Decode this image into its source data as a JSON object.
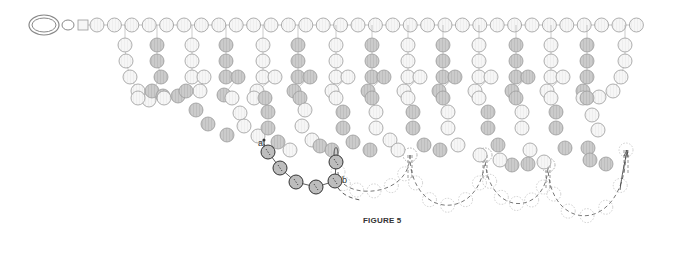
{
  "figure": {
    "caption": "FIGURE 5",
    "labels": {
      "a": "a",
      "b": "b"
    }
  },
  "colors": {
    "bead_white_fill": "#f5f5f5",
    "bead_gray_fill": "#c8c8c8",
    "bead_stroke": "#9a9a9a",
    "active_bead_fill": "#bdbdbd",
    "active_bead_stroke": "#333333",
    "ghost_stroke": "#b0b0b0",
    "thread": "#333333"
  },
  "clasp": {
    "ring_outer": {
      "cx": 44,
      "cy": 25,
      "rx": 15,
      "ry": 10
    },
    "ring_small": {
      "cx": 68,
      "cy": 25,
      "rx": 6,
      "ry": 5
    },
    "square": {
      "x": 78,
      "y": 20,
      "w": 10,
      "h": 10
    }
  },
  "top_row": {
    "start_x": 97,
    "y": 25,
    "count": 32,
    "spacing": 17.4,
    "r": 7
  },
  "fringes": [
    {
      "x": 125,
      "color": "white",
      "rows": [
        {
          "dx": 0,
          "dy": 20
        },
        {
          "dx": 1,
          "dy": 36
        },
        {
          "dx": 5,
          "dy": 52
        },
        {
          "dx": 13,
          "dy": 66
        },
        {
          "dx": 24,
          "dy": 75
        }
      ]
    },
    {
      "x": 157,
      "color": "gray",
      "rows": [
        {
          "dx": 0,
          "dy": 20
        },
        {
          "dx": 0,
          "dy": 36
        },
        {
          "dx": 4,
          "dy": 52
        },
        {
          "dx": -5,
          "dy": 66
        },
        {
          "dx": 6,
          "dy": 71
        }
      ]
    },
    {
      "x": 192,
      "color": "white",
      "rows": [
        {
          "dx": 0,
          "dy": 20
        },
        {
          "dx": 0,
          "dy": 36
        },
        {
          "dx": 0,
          "dy": 52
        },
        {
          "dx": 12,
          "dy": 52
        },
        {
          "dx": 8,
          "dy": 66
        }
      ]
    },
    {
      "x": 226,
      "color": "gray",
      "rows": [
        {
          "dx": 0,
          "dy": 20
        },
        {
          "dx": 0,
          "dy": 36
        },
        {
          "dx": 0,
          "dy": 52
        },
        {
          "dx": 12,
          "dy": 52
        },
        {
          "dx": -2,
          "dy": 70
        }
      ]
    },
    {
      "x": 263,
      "color": "white",
      "rows": [
        {
          "dx": 0,
          "dy": 20
        },
        {
          "dx": 0,
          "dy": 36
        },
        {
          "dx": 0,
          "dy": 52
        },
        {
          "dx": 12,
          "dy": 52
        },
        {
          "dx": -6,
          "dy": 66
        }
      ]
    },
    {
      "x": 298,
      "color": "gray",
      "rows": [
        {
          "dx": 0,
          "dy": 20
        },
        {
          "dx": 0,
          "dy": 36
        },
        {
          "dx": 0,
          "dy": 52
        },
        {
          "dx": 12,
          "dy": 52
        },
        {
          "dx": -4,
          "dy": 66
        }
      ]
    },
    {
      "x": 336,
      "color": "white",
      "rows": [
        {
          "dx": 0,
          "dy": 20
        },
        {
          "dx": 0,
          "dy": 36
        },
        {
          "dx": 0,
          "dy": 52
        },
        {
          "dx": 12,
          "dy": 52
        },
        {
          "dx": -4,
          "dy": 66
        }
      ]
    },
    {
      "x": 372,
      "color": "gray",
      "rows": [
        {
          "dx": 0,
          "dy": 20
        },
        {
          "dx": 0,
          "dy": 36
        },
        {
          "dx": 0,
          "dy": 52
        },
        {
          "dx": 12,
          "dy": 52
        },
        {
          "dx": -4,
          "dy": 66
        }
      ]
    },
    {
      "x": 408,
      "color": "white",
      "rows": [
        {
          "dx": 0,
          "dy": 20
        },
        {
          "dx": 0,
          "dy": 36
        },
        {
          "dx": 0,
          "dy": 52
        },
        {
          "dx": 12,
          "dy": 52
        },
        {
          "dx": -4,
          "dy": 66
        }
      ]
    },
    {
      "x": 443,
      "color": "gray",
      "rows": [
        {
          "dx": 0,
          "dy": 20
        },
        {
          "dx": 0,
          "dy": 36
        },
        {
          "dx": 0,
          "dy": 52
        },
        {
          "dx": 12,
          "dy": 52
        },
        {
          "dx": -4,
          "dy": 66
        }
      ]
    },
    {
      "x": 479,
      "color": "white",
      "rows": [
        {
          "dx": 0,
          "dy": 20
        },
        {
          "dx": 0,
          "dy": 36
        },
        {
          "dx": 0,
          "dy": 52
        },
        {
          "dx": 12,
          "dy": 52
        },
        {
          "dx": -4,
          "dy": 66
        }
      ]
    },
    {
      "x": 516,
      "color": "gray",
      "rows": [
        {
          "dx": 0,
          "dy": 20
        },
        {
          "dx": 0,
          "dy": 36
        },
        {
          "dx": 0,
          "dy": 52
        },
        {
          "dx": 12,
          "dy": 52
        },
        {
          "dx": -4,
          "dy": 66
        }
      ]
    },
    {
      "x": 551,
      "color": "white",
      "rows": [
        {
          "dx": 0,
          "dy": 20
        },
        {
          "dx": 0,
          "dy": 36
        },
        {
          "dx": 0,
          "dy": 52
        },
        {
          "dx": 12,
          "dy": 52
        },
        {
          "dx": -4,
          "dy": 66
        }
      ]
    },
    {
      "x": 587,
      "color": "gray",
      "rows": [
        {
          "dx": 0,
          "dy": 20
        },
        {
          "dx": 0,
          "dy": 36
        },
        {
          "dx": 0,
          "dy": 52
        },
        {
          "dx": -4,
          "dy": 66
        }
      ]
    },
    {
      "x": 625,
      "color": "white",
      "rows": [
        {
          "dx": 0,
          "dy": 20
        },
        {
          "dx": 0,
          "dy": 36
        },
        {
          "dx": -4,
          "dy": 52
        },
        {
          "dx": -12,
          "dy": 66
        },
        {
          "dx": -26,
          "dy": 72
        },
        {
          "dx": -42,
          "dy": 73
        }
      ]
    }
  ],
  "scatter_beads": [
    {
      "x": 138,
      "y": 98,
      "c": "white"
    },
    {
      "x": 164,
      "y": 98,
      "c": "white"
    },
    {
      "x": 178,
      "y": 96,
      "c": "gray"
    },
    {
      "x": 186,
      "y": 91,
      "c": "gray"
    },
    {
      "x": 196,
      "y": 110,
      "c": "gray"
    },
    {
      "x": 208,
      "y": 124,
      "c": "gray"
    },
    {
      "x": 227,
      "y": 135,
      "c": "gray"
    },
    {
      "x": 232,
      "y": 98,
      "c": "white"
    },
    {
      "x": 240,
      "y": 113,
      "c": "white"
    },
    {
      "x": 244,
      "y": 126,
      "c": "white"
    },
    {
      "x": 258,
      "y": 136,
      "c": "white"
    },
    {
      "x": 254,
      "y": 98,
      "c": "white"
    },
    {
      "x": 265,
      "y": 98,
      "c": "gray"
    },
    {
      "x": 268,
      "y": 112,
      "c": "gray"
    },
    {
      "x": 268,
      "y": 128,
      "c": "gray"
    },
    {
      "x": 278,
      "y": 142,
      "c": "gray"
    },
    {
      "x": 300,
      "y": 98,
      "c": "gray"
    },
    {
      "x": 305,
      "y": 110,
      "c": "white"
    },
    {
      "x": 302,
      "y": 126,
      "c": "white"
    },
    {
      "x": 312,
      "y": 140,
      "c": "white"
    },
    {
      "x": 320,
      "y": 146,
      "c": "gray"
    },
    {
      "x": 336,
      "y": 98,
      "c": "white"
    },
    {
      "x": 343,
      "y": 112,
      "c": "gray"
    },
    {
      "x": 343,
      "y": 128,
      "c": "gray"
    },
    {
      "x": 353,
      "y": 142,
      "c": "gray"
    },
    {
      "x": 372,
      "y": 98,
      "c": "gray"
    },
    {
      "x": 376,
      "y": 112,
      "c": "white"
    },
    {
      "x": 376,
      "y": 128,
      "c": "white"
    },
    {
      "x": 390,
      "y": 140,
      "c": "white"
    },
    {
      "x": 408,
      "y": 98,
      "c": "white"
    },
    {
      "x": 413,
      "y": 112,
      "c": "gray"
    },
    {
      "x": 413,
      "y": 128,
      "c": "gray"
    },
    {
      "x": 424,
      "y": 145,
      "c": "gray"
    },
    {
      "x": 443,
      "y": 98,
      "c": "gray"
    },
    {
      "x": 448,
      "y": 112,
      "c": "white"
    },
    {
      "x": 448,
      "y": 128,
      "c": "white"
    },
    {
      "x": 458,
      "y": 145,
      "c": "white"
    },
    {
      "x": 479,
      "y": 98,
      "c": "white"
    },
    {
      "x": 488,
      "y": 112,
      "c": "gray"
    },
    {
      "x": 488,
      "y": 128,
      "c": "gray"
    },
    {
      "x": 498,
      "y": 145,
      "c": "gray"
    },
    {
      "x": 516,
      "y": 98,
      "c": "gray"
    },
    {
      "x": 522,
      "y": 112,
      "c": "white"
    },
    {
      "x": 522,
      "y": 128,
      "c": "white"
    },
    {
      "x": 530,
      "y": 150,
      "c": "white"
    },
    {
      "x": 551,
      "y": 98,
      "c": "white"
    },
    {
      "x": 556,
      "y": 112,
      "c": "gray"
    },
    {
      "x": 556,
      "y": 128,
      "c": "gray"
    },
    {
      "x": 565,
      "y": 148,
      "c": "gray"
    },
    {
      "x": 587,
      "y": 98,
      "c": "gray"
    },
    {
      "x": 592,
      "y": 115,
      "c": "white"
    },
    {
      "x": 598,
      "y": 130,
      "c": "white"
    },
    {
      "x": 588,
      "y": 148,
      "c": "gray"
    },
    {
      "x": 590,
      "y": 160,
      "c": "gray"
    },
    {
      "x": 606,
      "y": 164,
      "c": "gray"
    },
    {
      "x": 512,
      "y": 165,
      "c": "gray"
    },
    {
      "x": 528,
      "y": 164,
      "c": "gray"
    },
    {
      "x": 544,
      "y": 162,
      "c": "white"
    },
    {
      "x": 480,
      "y": 155,
      "c": "white"
    },
    {
      "x": 440,
      "y": 150,
      "c": "gray"
    },
    {
      "x": 398,
      "y": 150,
      "c": "white"
    },
    {
      "x": 370,
      "y": 150,
      "c": "gray"
    },
    {
      "x": 332,
      "y": 150,
      "c": "gray"
    },
    {
      "x": 290,
      "y": 150,
      "c": "white"
    },
    {
      "x": 500,
      "y": 160,
      "c": "white"
    }
  ],
  "active_beads": [
    {
      "x": 268,
      "y": 152
    },
    {
      "x": 280,
      "y": 168
    },
    {
      "x": 296,
      "y": 182
    },
    {
      "x": 316,
      "y": 187
    },
    {
      "x": 335,
      "y": 181
    },
    {
      "x": 336,
      "y": 162
    }
  ],
  "ghost_arcs": [
    {
      "from": [
        338,
        172
      ],
      "to": [
        410,
        155
      ],
      "bottom": 200
    },
    {
      "from": [
        410,
        155
      ],
      "to": [
        485,
        155
      ],
      "bottom": 222
    },
    {
      "from": [
        485,
        155
      ],
      "to": [
        548,
        165
      ],
      "bottom": 218
    },
    {
      "from": [
        548,
        165
      ],
      "to": [
        626,
        150
      ],
      "bottom": 235
    }
  ]
}
